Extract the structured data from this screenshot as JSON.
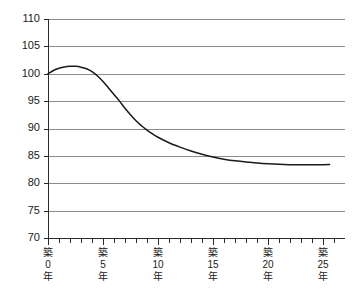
{
  "chart_data": {
    "type": "line",
    "title": "",
    "subtitle": "",
    "xlabel": "",
    "ylabel": "",
    "grid": true,
    "legend": "none",
    "xlim": [
      0,
      27
    ],
    "ylim": [
      70,
      110
    ],
    "y_ticks": [
      110,
      105,
      100,
      95,
      90,
      85,
      80,
      75,
      70
    ],
    "y_tick_labels": [
      "110",
      "105",
      "100",
      "95",
      "90",
      "85",
      "80",
      "75",
      "70"
    ],
    "x_tick_values": [
      0,
      1,
      2,
      3,
      4,
      5,
      6,
      7,
      8,
      9,
      10,
      11,
      12,
      13,
      14,
      15,
      16,
      17,
      18,
      19,
      20,
      21,
      22,
      23,
      24,
      25,
      26
    ],
    "x_major_ticks": [
      0,
      5,
      10,
      15,
      20,
      25
    ],
    "x_major_tick_labels": [
      {
        "lines": [
          "築",
          "0",
          "年"
        ]
      },
      {
        "lines": [
          "築",
          "5",
          "年"
        ]
      },
      {
        "lines": [
          "築",
          "10",
          "年"
        ]
      },
      {
        "lines": [
          "築",
          "15",
          "年"
        ]
      },
      {
        "lines": [
          "築",
          "20",
          "年"
        ]
      },
      {
        "lines": [
          "築",
          "25",
          "年"
        ]
      }
    ],
    "series": [
      {
        "name": "",
        "color": "#1a1a1a",
        "x": [
          0,
          0.5,
          1,
          1.5,
          2,
          2.5,
          3,
          3.5,
          4,
          4.5,
          5,
          5.5,
          6,
          6.5,
          7,
          7.5,
          8,
          8.5,
          9,
          9.5,
          10,
          11,
          12,
          13,
          14,
          15,
          16,
          17,
          18,
          19,
          20,
          21,
          22,
          23,
          24,
          25,
          25.6
        ],
        "values": [
          100.0,
          100.6,
          101.0,
          101.25,
          101.35,
          101.35,
          101.2,
          100.9,
          100.4,
          99.6,
          98.6,
          97.4,
          96.2,
          95.0,
          93.7,
          92.5,
          91.4,
          90.5,
          89.7,
          89.0,
          88.4,
          87.4,
          86.6,
          85.9,
          85.3,
          84.8,
          84.4,
          84.1,
          83.9,
          83.7,
          83.55,
          83.45,
          83.4,
          83.38,
          83.38,
          83.4,
          83.42
        ]
      }
    ]
  },
  "colors": {
    "gridline": "#8c8c8c",
    "axis": "#2b2b2b",
    "curve": "#1a1a1a",
    "background": "#ffffff",
    "text": "#1a1a1a"
  }
}
